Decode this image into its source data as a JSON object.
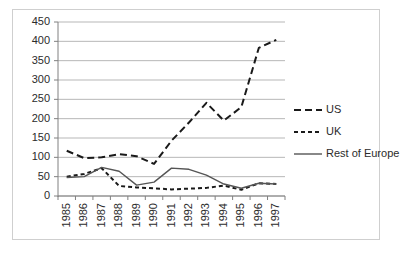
{
  "chart_data": {
    "type": "line",
    "title": "",
    "xlabel": "",
    "ylabel": "",
    "ylim": [
      0,
      450
    ],
    "y_ticks": [
      0,
      50,
      100,
      150,
      200,
      250,
      300,
      350,
      400,
      450
    ],
    "grid": true,
    "legend_position": "right",
    "categories": [
      "1985",
      "1986",
      "1987",
      "1988",
      "1989",
      "1990",
      "1991",
      "1992",
      "1993",
      "1994",
      "1995",
      "1996",
      "1997"
    ],
    "series": [
      {
        "name": "US",
        "style": "long-dash",
        "color": "#1a1a1a",
        "values": [
          117,
          98,
          100,
          108,
          103,
          83,
          143,
          190,
          241,
          195,
          230,
          383,
          404
        ]
      },
      {
        "name": "UK",
        "style": "short-dash",
        "color": "#1a1a1a",
        "values": [
          50,
          57,
          72,
          26,
          22,
          20,
          17,
          19,
          21,
          27,
          16,
          33,
          31
        ]
      },
      {
        "name": "Rest of Europe",
        "style": "solid",
        "color": "#555555",
        "values": [
          48,
          50,
          74,
          64,
          28,
          36,
          72,
          69,
          54,
          31,
          20,
          33,
          31
        ]
      }
    ]
  },
  "axes": {
    "y_tick_labels": [
      "450",
      "400",
      "350",
      "300",
      "250",
      "200",
      "150",
      "100",
      "50",
      "0"
    ],
    "x_tick_labels": [
      "1985",
      "1986",
      "1987",
      "1988",
      "1989",
      "1990",
      "1991",
      "1992",
      "1993",
      "1994",
      "1995",
      "1996",
      "1997"
    ]
  },
  "legend": {
    "items": [
      {
        "label": "US",
        "style": "long-dash"
      },
      {
        "label": "UK",
        "style": "short-dash"
      },
      {
        "label": "Rest of Europe",
        "style": "solid"
      }
    ]
  },
  "colors": {
    "grid": "#b7b7b7",
    "axis": "#808080",
    "frame": "#cfcfcf",
    "series_dark": "#1a1a1a",
    "series_gray": "#555555",
    "text": "#2b2b2b"
  }
}
